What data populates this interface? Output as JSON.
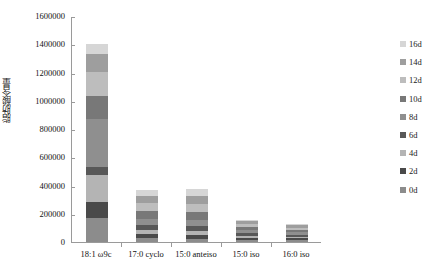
{
  "chart_data": {
    "type": "bar",
    "subtype": "stacked-bar",
    "title": "",
    "xlabel": "",
    "ylabel": "脂肪酸含量",
    "ylim": [
      0,
      1600000
    ],
    "ytick_step": 200000,
    "ytick_labels": [
      "1600000",
      "1400000",
      "1200000",
      "1000000",
      "800000",
      "600000",
      "400000",
      "200000",
      "0"
    ],
    "grid": false,
    "legend_position": "right",
    "categories": [
      "18:1 ω9c",
      "17:0 cyclo",
      "15:0 anteiso",
      "15:0 iso",
      "16:0 iso"
    ],
    "series": [
      {
        "name": "0d",
        "color": "#8c8c8c",
        "values": [
          168000,
          28000,
          22000,
          14000,
          13000
        ]
      },
      {
        "name": "2d",
        "color": "#4a4a4a",
        "values": [
          112000,
          26000,
          26000,
          14000,
          13000
        ]
      },
      {
        "name": "4d",
        "color": "#b4b4b4",
        "values": [
          196000,
          30000,
          29000,
          16000,
          12000
        ]
      },
      {
        "name": "6d",
        "color": "#585858",
        "values": [
          56000,
          34000,
          36000,
          17000,
          14000
        ]
      },
      {
        "name": "8d",
        "color": "#8f8f8f",
        "values": [
          336000,
          45000,
          46000,
          21000,
          16000
        ]
      },
      {
        "name": "10d",
        "color": "#787878",
        "values": [
          168000,
          56000,
          52000,
          23000,
          18000
        ]
      },
      {
        "name": "12d",
        "color": "#bdbdbd",
        "values": [
          168000,
          55000,
          56000,
          21000,
          16000
        ]
      },
      {
        "name": "14d",
        "color": "#9e9e9e",
        "values": [
          126000,
          52000,
          58000,
          20000,
          16000
        ]
      },
      {
        "name": "16d",
        "color": "#d6d6d6",
        "values": [
          70000,
          44000,
          50000,
          14000,
          12000
        ]
      }
    ],
    "totals": [
      1400000,
      370000,
      375000,
      160000,
      130000
    ]
  },
  "axis": {
    "y_title": "脂肪酸含量",
    "ticks": [
      {
        "label": "1600000",
        "value": 1600000
      },
      {
        "label": "1400000",
        "value": 1400000
      },
      {
        "label": "1200000",
        "value": 1200000
      },
      {
        "label": "1000000",
        "value": 1000000
      },
      {
        "label": "800000",
        "value": 800000
      },
      {
        "label": "600000",
        "value": 600000
      },
      {
        "label": "400000",
        "value": 400000
      },
      {
        "label": "200000",
        "value": 200000
      },
      {
        "label": "0",
        "value": 0
      }
    ],
    "categories": [
      "18:1 ω9c",
      "17:0 cyclo",
      "15:0 anteiso",
      "15:0 iso",
      "16:0 iso"
    ]
  },
  "legend": {
    "items": [
      {
        "label": "16d",
        "color": "#d6d6d6"
      },
      {
        "label": "14d",
        "color": "#9e9e9e"
      },
      {
        "label": "12d",
        "color": "#bdbdbd"
      },
      {
        "label": "10d",
        "color": "#787878"
      },
      {
        "label": "8d",
        "color": "#8f8f8f"
      },
      {
        "label": "6d",
        "color": "#585858"
      },
      {
        "label": "4d",
        "color": "#b4b4b4"
      },
      {
        "label": "2d",
        "color": "#4a4a4a"
      },
      {
        "label": "0d",
        "color": "#8c8c8c"
      }
    ]
  },
  "colors": {
    "axis_line": "#9a9a9a",
    "text": "#111111",
    "background": "#ffffff"
  }
}
